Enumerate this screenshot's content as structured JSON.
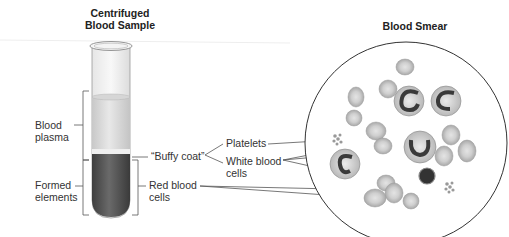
{
  "titles": {
    "left_line1": "Centrifuged",
    "left_line2": "Blood Sample",
    "right": "Blood Smear"
  },
  "tube_labels": {
    "plasma_line1": "Blood",
    "plasma_line2": "plasma",
    "formed_line1": "Formed",
    "formed_line2": "elements",
    "buffy_coat": "“Buffy coat”",
    "red_line1": "Red blood",
    "red_line2": "cells"
  },
  "smear_labels": {
    "platelets": "Platelets",
    "wbc_line1": "White blood",
    "wbc_line2": "cells"
  },
  "colors": {
    "plasma": "#d9d9d9",
    "formed_elements": "#5a5a5a",
    "rbc": "#cfcfcf",
    "wbc_nucleus": "#3a3a3a",
    "line": "#444444"
  }
}
